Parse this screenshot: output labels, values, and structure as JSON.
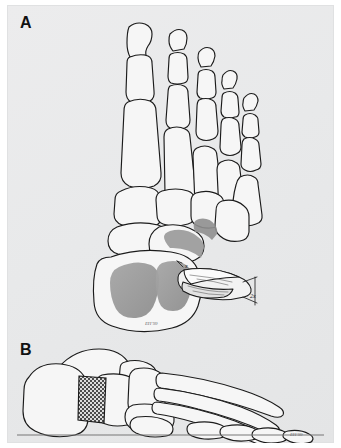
{
  "figure": {
    "type": "medical-illustration",
    "background_color": "#e8e9ea",
    "ink_color": "#1b1b1b",
    "bone_fill": "#f4f4f4",
    "shade_color": "#9a9a9a",
    "hatch_color": "#4a4a4a"
  },
  "panels": [
    {
      "id": "A",
      "label": "A",
      "view": "dorsal-oblique",
      "description": "Dorsal oblique view of foot skeleton with shaded calcaneal osteotomy regions and inset bone graft wedge"
    },
    {
      "id": "B",
      "label": "B",
      "view": "lateral",
      "description": "Lateral view of foot skeleton with cross-hatched bone graft block inserted in calcaneus, resting on ground line"
    }
  ],
  "panel_a": {
    "label": "A",
    "signature": "EH '99",
    "inset": {
      "name": "bone-graft-wedge",
      "label_small": "x",
      "label_large": "2x"
    }
  },
  "panel_b": {
    "label": "B",
    "signature": "EH '99",
    "graft": {
      "name": "graft-block",
      "pattern": "cross-hatch"
    }
  }
}
